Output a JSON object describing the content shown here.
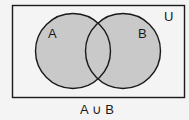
{
  "diagram": {
    "type": "venn",
    "universe_label": "U",
    "sets": [
      {
        "label": "A",
        "shaded": true
      },
      {
        "label": "B",
        "shaded": true
      }
    ],
    "caption": "A ∪ B",
    "colors": {
      "background": "#f4f4f4",
      "shade": "#c9c9c9",
      "stroke": "#1a1a1a"
    }
  }
}
